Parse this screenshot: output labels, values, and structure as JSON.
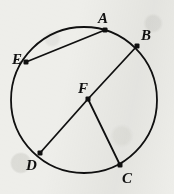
{
  "figure": {
    "kind": "circle-geometry-diagram",
    "caption": "",
    "width": 174,
    "height": 194,
    "background_color": "#eeeeea",
    "ink_color": "#101010",
    "circle": {
      "name": "main-circle",
      "center_label": "F",
      "cx": 84,
      "cy": 100,
      "r": 73,
      "stroke_width": 1.8,
      "fill": "none"
    },
    "points": [
      {
        "id": "A",
        "label": "A",
        "x": 105,
        "y": 30,
        "on_circle": true,
        "label_x": 98,
        "label_y": 11
      },
      {
        "id": "B",
        "label": "B",
        "x": 137,
        "y": 46,
        "on_circle": true,
        "label_x": 141,
        "label_y": 28
      },
      {
        "id": "C",
        "label": "C",
        "x": 120,
        "y": 165,
        "on_circle": true,
        "label_x": 122,
        "label_y": 171
      },
      {
        "id": "D",
        "label": "D",
        "x": 40,
        "y": 153,
        "on_circle": true,
        "label_x": 26,
        "label_y": 158
      },
      {
        "id": "E",
        "label": "E",
        "x": 26,
        "y": 62,
        "on_circle": true,
        "label_x": 12,
        "label_y": 52
      },
      {
        "id": "F",
        "label": "F",
        "x": 88,
        "y": 99,
        "on_circle": false,
        "label_x": 78,
        "label_y": 81
      }
    ],
    "point_marker": {
      "shape": "filled-square-dot",
      "size": 5
    },
    "segments": [
      {
        "id": "EA",
        "name": "chord-e-a",
        "from": "E",
        "to": "A",
        "kind": "chord"
      },
      {
        "id": "DF",
        "name": "radius-d-f",
        "from": "D",
        "to": "F",
        "kind": "radius"
      },
      {
        "id": "FB",
        "name": "radius-f-b",
        "from": "F",
        "to": "B",
        "kind": "radius"
      },
      {
        "id": "FC",
        "name": "radius-f-c",
        "from": "F",
        "to": "C",
        "kind": "radius"
      }
    ]
  }
}
